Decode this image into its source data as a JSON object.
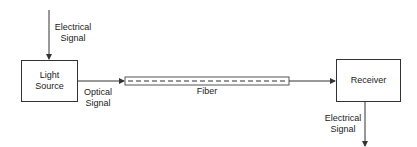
{
  "diagram": {
    "type": "block-diagram",
    "nodes": [
      {
        "id": "light_source",
        "label": "Light\nSource"
      },
      {
        "id": "fiber",
        "label": "Fiber"
      },
      {
        "id": "receiver",
        "label": "Receiver"
      }
    ],
    "labels": {
      "input_signal": "Electrical\nSignal",
      "optical_signal": "Optical\nSignal",
      "fiber": "Fiber",
      "output_signal": "Electrical\nSignal"
    },
    "edges": [
      {
        "from": "input",
        "to": "light_source",
        "label": "Electrical Signal"
      },
      {
        "from": "light_source",
        "to": "fiber",
        "label": "Optical Signal"
      },
      {
        "from": "fiber",
        "to": "receiver"
      },
      {
        "from": "receiver",
        "to": "output",
        "label": "Electrical Signal"
      }
    ],
    "colors": {
      "line": "#333333",
      "background": "#ffffff"
    }
  }
}
